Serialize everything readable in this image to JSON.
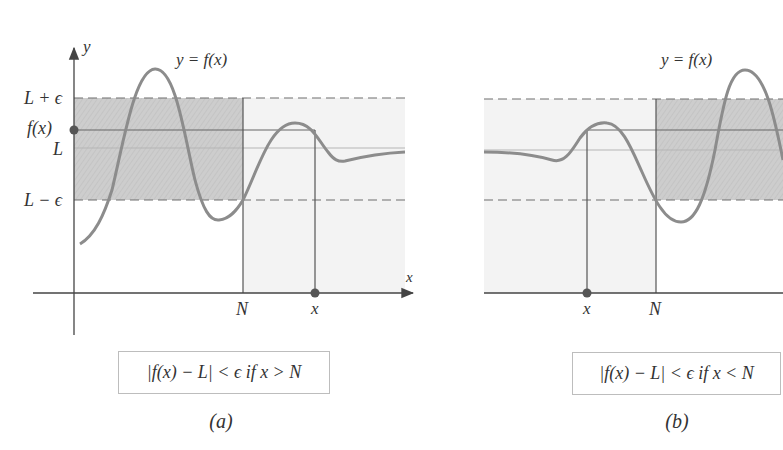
{
  "panels": [
    {
      "id": "a",
      "caption": "(a)",
      "curve_label": "y = f(x)",
      "y_axis_label": "y",
      "x_axis_label": "x",
      "y_tick_labels": [
        "L + ϵ",
        "f(x)",
        "L",
        "L − ϵ"
      ],
      "x_tick_labels": [
        "N",
        "x"
      ],
      "condition": "|f(x) − L| < ϵ if x > N"
    },
    {
      "id": "b",
      "caption": "(b)",
      "curve_label": "y = f(x)",
      "x_tick_labels": [
        "x",
        "N"
      ],
      "condition": "|f(x) − L| < ϵ if x < N"
    }
  ],
  "colors": {
    "curve": "#8c8c8c",
    "axis": "#555555",
    "band_shade": "#cfcfcf",
    "light_shade": "#f3f3f3",
    "dashed": "#6e6e6e",
    "point": "#555555"
  }
}
